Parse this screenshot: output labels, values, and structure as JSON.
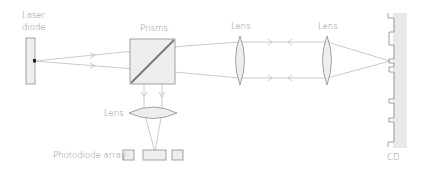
{
  "diagram": {
    "labels": {
      "laser_diode_line1": "Laser",
      "laser_diode_line2": "diode",
      "prisms": "Prisms",
      "lens_1": "Lens",
      "lens_2": "Lens",
      "lens_lower": "Lens",
      "photodiode_array": "Photodiode array",
      "cd": "CD"
    },
    "colors": {
      "line": "#8c8c8c",
      "beam": "#c4c4c4",
      "fill": "#eeeeee",
      "cd_fill": "#e9e9e9",
      "diode_dot": "#222222",
      "text": "#8a8a8a"
    },
    "components": [
      {
        "name": "laser-diode",
        "label": "Laser diode"
      },
      {
        "name": "prism-beam-splitter",
        "label": "Prisms"
      },
      {
        "name": "collimator-lens",
        "label": "Lens"
      },
      {
        "name": "objective-lens",
        "label": "Lens"
      },
      {
        "name": "cd-surface",
        "label": "CD"
      },
      {
        "name": "focusing-lens",
        "label": "Lens"
      },
      {
        "name": "photodiode-array",
        "label": "Photodiode array",
        "cells": 3
      }
    ]
  }
}
